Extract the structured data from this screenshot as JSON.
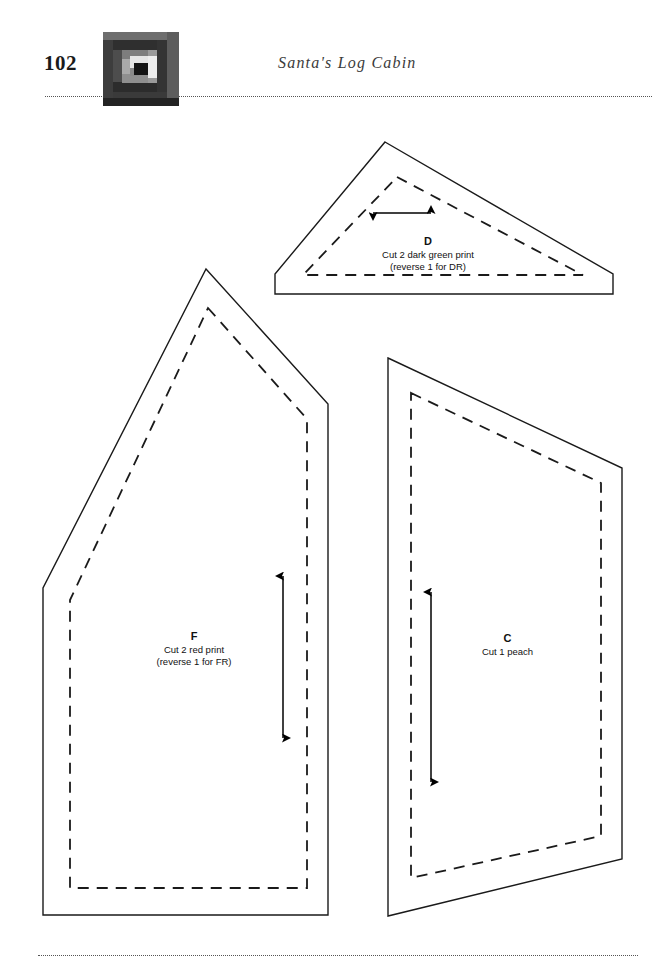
{
  "document": {
    "page_number": "102",
    "chapter_title": "Santa's Log Cabin",
    "type": "quilt pattern template page"
  },
  "header": {
    "page_number": "102",
    "title": "Santa's Log Cabin",
    "block_thumbnail_name": "log-cabin-block",
    "rule_style": "dotted"
  },
  "footer": {
    "rule_style": "dotted"
  },
  "block_thumbnail": {
    "colors": {
      "outer_dark": "#2b2b2b",
      "outer_mid": "#4a4a4a",
      "outer_light": "#6e6e6e",
      "ring_gray": "#8d8d8d",
      "ring_light": "#b8b8b8",
      "inner_white": "#e8e8e8",
      "center_black": "#141414",
      "bottom_bar": "#232323"
    }
  },
  "pieces": [
    {
      "id": "D",
      "letter": "D",
      "lines": [
        "Cut 2 dark green print",
        "(reverse 1 for DR)"
      ],
      "shape": "triangle-with-base",
      "grainline": "horizontal",
      "cut_count": 2,
      "fabric": "dark green print",
      "reverse_note": "reverse 1 for DR"
    },
    {
      "id": "F",
      "letter": "F",
      "lines": [
        "Cut 2 red print",
        "(reverse 1 for FR)"
      ],
      "shape": "pentagon",
      "grainline": "vertical",
      "cut_count": 2,
      "fabric": "red print",
      "reverse_note": "reverse 1 for FR"
    },
    {
      "id": "C",
      "letter": "C",
      "lines": [
        "Cut 1 peach"
      ],
      "shape": "trapezoid",
      "grainline": "vertical",
      "cut_count": 1,
      "fabric": "peach",
      "reverse_note": ""
    }
  ],
  "colors": {
    "ink": "#000000",
    "paper": "#ffffff",
    "rule": "#555555",
    "title_ink": "#3b3b3b"
  }
}
